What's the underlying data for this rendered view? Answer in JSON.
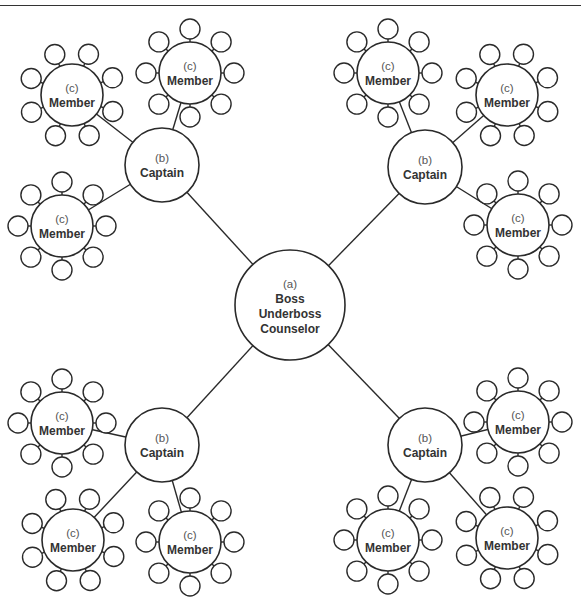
{
  "diagram": {
    "title": "",
    "boss": {
      "id": "boss",
      "code": "(a)",
      "roles": [
        "Boss",
        "Underboss",
        "Counselor"
      ],
      "x": 290,
      "y": 305,
      "r": 55
    },
    "satellite_radius": 10,
    "satellite_distance": 44,
    "satellites_per_member": 8,
    "captains": [
      {
        "id": "captain-top-left",
        "code": "(b)",
        "role": "Captain",
        "x": 162,
        "y": 165,
        "r": 37,
        "members": [
          {
            "code": "(c)",
            "role": "Member",
            "x": 72,
            "y": 95,
            "r": 31,
            "rot": 22
          },
          {
            "code": "(c)",
            "role": "Member",
            "x": 190,
            "y": 73,
            "r": 31,
            "rot": 0
          },
          {
            "code": "(c)",
            "role": "Member",
            "x": 62,
            "y": 226,
            "r": 31,
            "rot": 0
          }
        ]
      },
      {
        "id": "captain-top-right",
        "code": "(b)",
        "role": "Captain",
        "x": 425,
        "y": 167,
        "r": 37,
        "members": [
          {
            "code": "(c)",
            "role": "Member",
            "x": 388,
            "y": 73,
            "r": 31,
            "rot": 0
          },
          {
            "code": "(c)",
            "role": "Member",
            "x": 507,
            "y": 95,
            "r": 31,
            "rot": 22
          },
          {
            "code": "(c)",
            "role": "Member",
            "x": 518,
            "y": 225,
            "r": 31,
            "rot": 0
          }
        ]
      },
      {
        "id": "captain-bottom-left",
        "code": "(b)",
        "role": "Captain",
        "x": 162,
        "y": 445,
        "r": 37,
        "members": [
          {
            "code": "(c)",
            "role": "Member",
            "x": 62,
            "y": 423,
            "r": 31,
            "rot": 0
          },
          {
            "code": "(c)",
            "role": "Member",
            "x": 73,
            "y": 540,
            "r": 31,
            "rot": 22
          },
          {
            "code": "(c)",
            "role": "Member",
            "x": 190,
            "y": 542,
            "r": 31,
            "rot": 0
          }
        ]
      },
      {
        "id": "captain-bottom-right",
        "code": "(b)",
        "role": "Captain",
        "x": 425,
        "y": 445,
        "r": 37,
        "members": [
          {
            "code": "(c)",
            "role": "Member",
            "x": 518,
            "y": 422,
            "r": 31,
            "rot": 0
          },
          {
            "code": "(c)",
            "role": "Member",
            "x": 388,
            "y": 540,
            "r": 31,
            "rot": 0
          },
          {
            "code": "(c)",
            "role": "Member",
            "x": 507,
            "y": 538,
            "r": 31,
            "rot": 22
          }
        ]
      }
    ],
    "colors": {
      "stroke": "#2a2a2a",
      "code_text": "#555555",
      "role_text": "#333333",
      "background": "#ffffff"
    }
  }
}
